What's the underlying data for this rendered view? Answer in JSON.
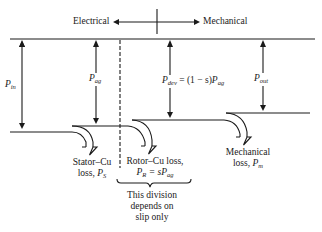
{
  "header": {
    "left_label": "Electrical",
    "right_label": "Mechanical"
  },
  "powers": [
    {
      "symbol": "P",
      "sub": "in"
    },
    {
      "symbol": "P",
      "sub": "ag"
    },
    {
      "symbol": "P",
      "sub": "dev",
      "expr_mid": " = (1 − s)",
      "expr_sym": "P",
      "expr_sub": "ag"
    },
    {
      "symbol": "P",
      "sub": "out"
    }
  ],
  "losses": [
    {
      "line1": "Stator–Cu",
      "line2_text": "loss, ",
      "sym": "P",
      "sub": "S"
    },
    {
      "line1": "Rotor–Cu loss,",
      "line2_sym": "P",
      "line2_sub": "R",
      "line2_mid": " = s",
      "line2_sym2": "P",
      "line2_sub2": "ag"
    },
    {
      "line1": "Mechanical",
      "line2_text": "loss, ",
      "sym": "P",
      "sub": "m"
    }
  ],
  "note": {
    "line1": "This division",
    "line2": "depends on",
    "line3": "slip only"
  },
  "colors": {
    "ink": "#1a1a1a",
    "background": "#ffffff"
  }
}
